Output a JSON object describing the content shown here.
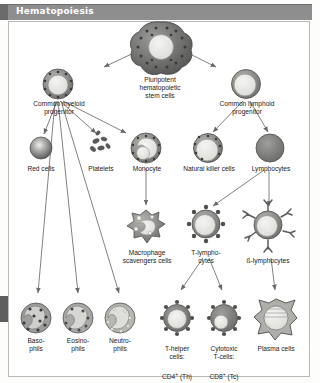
{
  "header": {
    "title": "Hematopoiesis"
  },
  "colors": {
    "header_bar": "#8e8e8e",
    "header_text": "#ffffff",
    "frame_border": "#b8b8b4",
    "background": "#ffffff",
    "cell_dark": "#6e6e6e",
    "cell_mid": "#9a9a9a",
    "cell_light": "#e8e8e6",
    "granule": "#4a4a4a",
    "arrow": "#6a6a6a"
  },
  "diagram": {
    "type": "flow-diagram",
    "nodes": [
      {
        "id": "stem",
        "label": "Pluripotent\nhematopoietic\nstem cells",
        "x": 160,
        "y": 48,
        "cell": "stem"
      },
      {
        "id": "myeloid",
        "label": "Common myeloid\nprogenitor",
        "x": 58,
        "y": 78,
        "cell": "granular-ring"
      },
      {
        "id": "lymphoid",
        "label": "Common lymphoid\nprogenitor",
        "x": 246,
        "y": 78,
        "cell": "plain-ring"
      },
      {
        "id": "redcells",
        "label": "Red cells",
        "x": 41,
        "y": 157,
        "cell": "sphere"
      },
      {
        "id": "platelets",
        "label": "Platelets",
        "x": 101,
        "y": 157,
        "cell": "platelets"
      },
      {
        "id": "monocyte",
        "label": "Monocyte",
        "x": 146,
        "y": 157,
        "cell": "monocyte"
      },
      {
        "id": "nk",
        "label": "Natural killer cells",
        "x": 208,
        "y": 157,
        "cell": "granular-ring"
      },
      {
        "id": "lymphocytes",
        "label": "Lymphocytes",
        "x": 270,
        "y": 157,
        "cell": "solid-disc"
      },
      {
        "id": "macrophage",
        "label": "Macrophage\nscavengers cells",
        "x": 146,
        "y": 232,
        "cell": "macrophage"
      },
      {
        "id": "tlympho",
        "label": "T-lympho-\ncytes",
        "x": 206,
        "y": 232,
        "cell": "spiky-receptor"
      },
      {
        "id": "blympho",
        "label": "ß-lymphocytes",
        "x": 268,
        "y": 232,
        "cell": "antibody"
      },
      {
        "id": "basophils",
        "label": "Baso-\nphils",
        "x": 36,
        "y": 318,
        "cell": "granulocyte-dark"
      },
      {
        "id": "eosinophils",
        "label": "Eosino-\nphils",
        "x": 78,
        "y": 318,
        "cell": "granulocyte-mid"
      },
      {
        "id": "neutrophils",
        "label": "Neutro-\nphils",
        "x": 120,
        "y": 318,
        "cell": "granulocyte-light"
      },
      {
        "id": "thelper",
        "label": "T-helper\ncells:",
        "x": 177,
        "y": 318,
        "cell": "spiky-receptor",
        "sublabel": "CD4",
        "supscript": "+",
        "subtail": " (Th)"
      },
      {
        "id": "cytotoxic",
        "label": "Cytotoxic\nT-cells:",
        "x": 224,
        "y": 318,
        "cell": "spiky-receptor",
        "sublabel": "CD8",
        "supscript": "+",
        "subtail": " (Tc)"
      },
      {
        "id": "plasma",
        "label": "Plasma cells",
        "x": 276,
        "y": 318,
        "cell": "plasma"
      }
    ],
    "edges": [
      {
        "from": "stem",
        "to": "myeloid"
      },
      {
        "from": "stem",
        "to": "lymphoid"
      },
      {
        "from": "myeloid",
        "to": "redcells"
      },
      {
        "from": "myeloid",
        "to": "platelets"
      },
      {
        "from": "myeloid",
        "to": "monocyte"
      },
      {
        "from": "myeloid",
        "to": "basophils"
      },
      {
        "from": "myeloid",
        "to": "eosinophils"
      },
      {
        "from": "myeloid",
        "to": "neutrophils"
      },
      {
        "from": "lymphoid",
        "to": "nk"
      },
      {
        "from": "lymphoid",
        "to": "lymphocytes"
      },
      {
        "from": "monocyte",
        "to": "macrophage"
      },
      {
        "from": "lymphocytes",
        "to": "tlympho"
      },
      {
        "from": "lymphocytes",
        "to": "blympho"
      },
      {
        "from": "tlympho",
        "to": "thelper"
      },
      {
        "from": "tlympho",
        "to": "cytotoxic"
      },
      {
        "from": "blympho",
        "to": "plasma"
      }
    ]
  }
}
